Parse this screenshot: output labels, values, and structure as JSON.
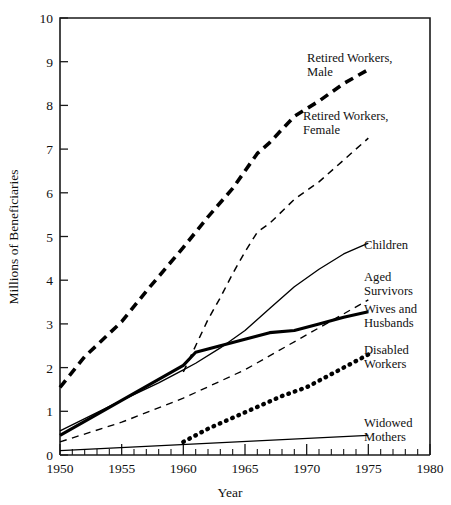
{
  "chart_data": {
    "type": "line",
    "title": "",
    "subtitle": "",
    "xlabel": "Year",
    "ylabel": "Millions of Beneficiaries",
    "xlim": [
      1950,
      1980
    ],
    "ylim": [
      0,
      10
    ],
    "grid": false,
    "legend_position": "inline-right-labels",
    "x_major_ticks": [
      1950,
      1955,
      1960,
      1965,
      1970,
      1975,
      1980
    ],
    "x_minor_tick_interval": 1,
    "y_ticks": [
      0,
      1,
      2,
      3,
      4,
      5,
      6,
      7,
      8,
      9,
      10
    ],
    "x_tick_labels": [
      "1950",
      "1955",
      "1960",
      "1965",
      "1970",
      "1975",
      "1980"
    ],
    "y_tick_labels": [
      "0",
      "1",
      "2",
      "3",
      "4",
      "5",
      "6",
      "7",
      "8",
      "9",
      "10"
    ],
    "series": [
      {
        "name": "Retired Workers, Male",
        "label": "Retired Workers,\nMale",
        "label_line1": "Retired Workers,",
        "label_line2": "Male",
        "style": "dashed-thick",
        "x": [
          1950,
          1952,
          1955,
          1957,
          1960,
          1962,
          1964,
          1966,
          1967,
          1969,
          1971,
          1973,
          1975
        ],
        "values": [
          1.55,
          2.25,
          3.05,
          3.75,
          4.75,
          5.45,
          6.1,
          6.9,
          7.15,
          7.75,
          8.1,
          8.5,
          8.82
        ]
      },
      {
        "name": "Retired Workers, Female",
        "label": "Retired Workers,\nFemale",
        "label_line1": "Retired Workers,",
        "label_line2": "Female",
        "style": "dashed-thin",
        "x": [
          1960,
          1961,
          1962,
          1963,
          1964,
          1965,
          1966,
          1967,
          1969,
          1971,
          1973,
          1975
        ],
        "values": [
          1.9,
          2.5,
          3.1,
          3.6,
          4.15,
          4.65,
          5.1,
          5.3,
          5.85,
          6.25,
          6.75,
          7.25
        ]
      },
      {
        "name": "Children",
        "label": "Children",
        "label_line1": "Children",
        "label_line2": "",
        "style": "solid-thin",
        "x": [
          1950,
          1955,
          1958,
          1960,
          1961,
          1963,
          1965,
          1967,
          1969,
          1971,
          1973,
          1975
        ],
        "values": [
          0.55,
          1.25,
          1.65,
          1.95,
          2.1,
          2.45,
          2.85,
          3.35,
          3.85,
          4.25,
          4.6,
          4.85
        ]
      },
      {
        "name": "Aged Survivors",
        "label": "Aged\nSurvivors",
        "label_line1": "Aged",
        "label_line2": "Survivors",
        "style": "dashed-thin",
        "x": [
          1950,
          1955,
          1960,
          1965,
          1970,
          1975
        ],
        "values": [
          0.3,
          0.75,
          1.3,
          1.95,
          2.75,
          3.55
        ]
      },
      {
        "name": "Wives and Husbands",
        "label": "Wives and\nHusbands",
        "label_line1": "Wives and",
        "label_line2": "Husbands",
        "style": "solid-thick",
        "x": [
          1950,
          1955,
          1960,
          1961,
          1963,
          1965,
          1967,
          1969,
          1971,
          1973,
          1975
        ],
        "values": [
          0.45,
          1.25,
          2.05,
          2.35,
          2.5,
          2.65,
          2.8,
          2.85,
          3.0,
          3.15,
          3.28
        ]
      },
      {
        "name": "Disabled Workers",
        "label": "Disabled\nWorkers",
        "label_line1": "Disabled",
        "label_line2": "Workers",
        "style": "dotted",
        "x": [
          1960,
          1962,
          1964,
          1966,
          1968,
          1970,
          1972,
          1973,
          1974,
          1975
        ],
        "values": [
          0.3,
          0.6,
          0.85,
          1.1,
          1.35,
          1.55,
          1.85,
          2.0,
          2.15,
          2.3
        ]
      },
      {
        "name": "Widowed Mothers",
        "label": "Widowed\nMothers",
        "label_line1": "Widowed",
        "label_line2": "Mothers",
        "style": "solid-thin",
        "x": [
          1950,
          1975
        ],
        "values": [
          0.1,
          0.45
        ]
      }
    ]
  },
  "annotations": {
    "retired_male": {
      "line1": "Retired Workers,",
      "line2": "Male"
    },
    "retired_female": {
      "line1": "Retired Workers,",
      "line2": "Female"
    },
    "children": {
      "line1": "Children",
      "line2": ""
    },
    "aged_survivors": {
      "line1": "Aged",
      "line2": "Survivors"
    },
    "wives_husbands": {
      "line1": "Wives and",
      "line2": "Husbands"
    },
    "disabled_workers": {
      "line1": "Disabled",
      "line2": "Workers"
    },
    "widowed_mothers": {
      "line1": "Widowed",
      "line2": "Mothers"
    }
  },
  "axes": {
    "x_title": "Year",
    "y_title": "Millions of Beneficiaries",
    "x_labels": [
      "1950",
      "1955",
      "1960",
      "1965",
      "1970",
      "1975",
      "1980"
    ],
    "y_labels": [
      "0",
      "1",
      "2",
      "3",
      "4",
      "5",
      "6",
      "7",
      "8",
      "9",
      "10"
    ]
  }
}
